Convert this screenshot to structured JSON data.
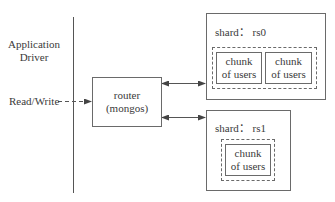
{
  "diagram": {
    "client": {
      "label_line1": "Application",
      "label_line2": "Driver",
      "action_label": "Read/Write"
    },
    "router": {
      "label_line1": "router",
      "label_line2": "(mongos)"
    },
    "shards": [
      {
        "label": "shard： rs0",
        "chunks": [
          {
            "line1": "chunk",
            "line2": "of users"
          },
          {
            "line1": "chunk",
            "line2": "of users"
          }
        ]
      },
      {
        "label": "shard： rs1",
        "chunks": [
          {
            "line1": "chunk",
            "line2": "of users"
          }
        ]
      }
    ],
    "edges": [
      {
        "from": "client",
        "to": "router",
        "style": "dashed",
        "direction": "forward"
      },
      {
        "from": "router",
        "to": "shard-rs0",
        "style": "solid",
        "direction": "both"
      },
      {
        "from": "router",
        "to": "shard-rs1",
        "style": "solid",
        "direction": "both"
      }
    ],
    "colors": {
      "line": "#6a6a6a",
      "text": "#3a3a3a",
      "background": "#ffffff"
    }
  }
}
